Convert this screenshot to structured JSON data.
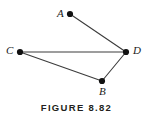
{
  "figure": {
    "caption": "FIGURE 8.82",
    "background_color": "#ffffff",
    "edge_color": "#3c3c3c",
    "vertex_color": "#111111",
    "label_color": "#1a1a1a",
    "caption_color": "#231f20",
    "width": 153,
    "height": 120
  },
  "chart_data": {
    "type": "scatter",
    "title": "FIGURE 8.82",
    "xlabel": "",
    "ylabel": "",
    "grid": false,
    "legend": null,
    "xlim": [
      0,
      153
    ],
    "ylim": [
      0,
      100
    ],
    "vertices": [
      {
        "id": "A",
        "label": "A",
        "x": 70,
        "y": 14,
        "label_x": 57,
        "label_y": 8,
        "label_position": "left"
      },
      {
        "id": "B",
        "label": "B",
        "x": 102,
        "y": 81,
        "label_x": 99,
        "label_y": 86,
        "label_position": "below"
      },
      {
        "id": "C",
        "label": "C",
        "x": 20,
        "y": 52,
        "label_x": 6,
        "label_y": 45,
        "label_position": "left"
      },
      {
        "id": "D",
        "label": "D",
        "x": 126,
        "y": 52,
        "label_x": 133,
        "label_y": 45,
        "label_position": "right"
      }
    ],
    "edges": [
      {
        "from": "A",
        "to": "D",
        "x1": 70,
        "y1": 14,
        "x2": 126,
        "y2": 52
      },
      {
        "from": "C",
        "to": "D",
        "x1": 20,
        "y1": 52,
        "x2": 126,
        "y2": 52
      },
      {
        "from": "C",
        "to": "B",
        "x1": 20,
        "y1": 52,
        "x2": 102,
        "y2": 81
      },
      {
        "from": "B",
        "to": "D",
        "x1": 102,
        "y1": 81,
        "x2": 126,
        "y2": 52
      }
    ],
    "vertex_radius": 3.1
  }
}
